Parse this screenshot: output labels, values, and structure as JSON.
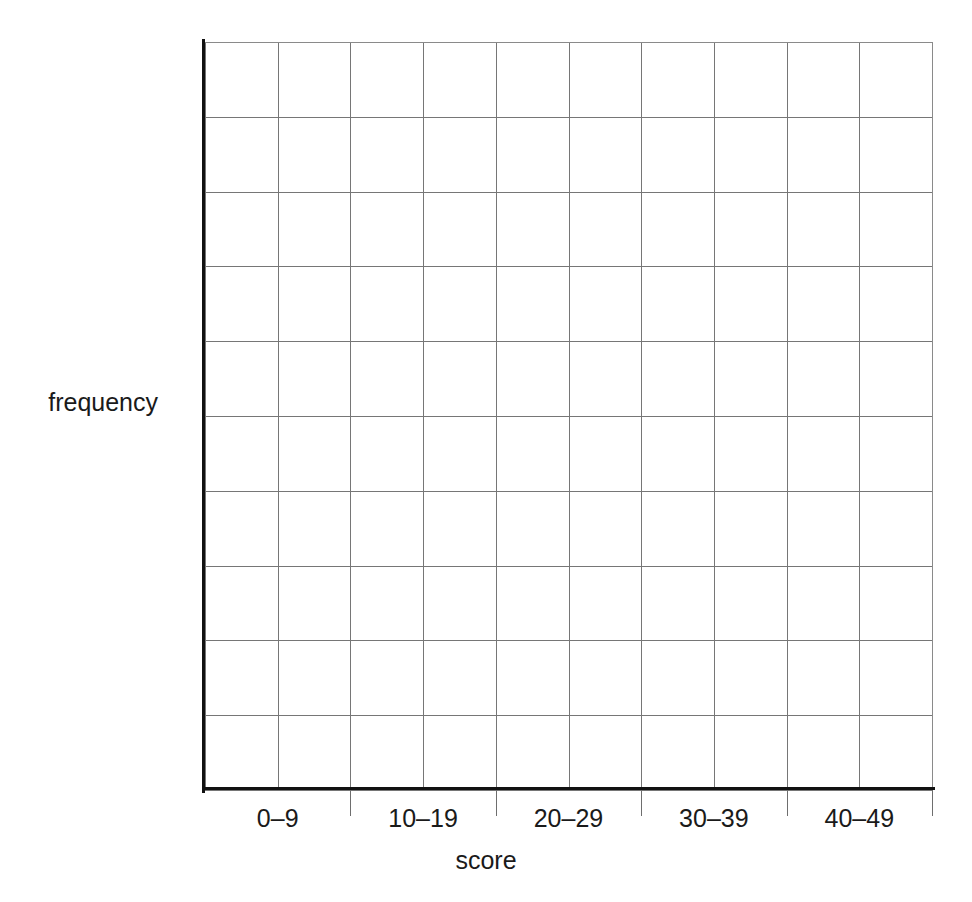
{
  "chart_data": {
    "type": "bar",
    "title": "",
    "subtitle": "",
    "xlabel": "score",
    "ylabel": "frequency",
    "categories": [
      "0–9",
      "10–19",
      "20–29",
      "30–39",
      "40–49"
    ],
    "values": [
      null,
      null,
      null,
      null,
      null
    ],
    "series": [
      {
        "name": "frequency",
        "values": [
          null,
          null,
          null,
          null,
          null
        ]
      }
    ],
    "note": "Empty grid template — no bars drawn; axes unlabelled numerically",
    "grid": true,
    "grid_columns": 10,
    "grid_rows": 10,
    "legend": false,
    "legend_position": "none",
    "annotations": [],
    "ylim": [
      null,
      null
    ],
    "ytick_labels": [],
    "xtick_labels": [
      "0–9",
      "10–19",
      "20–29",
      "30–39",
      "40–49"
    ],
    "colors": {
      "background": "#ffffff",
      "grid": "#767676",
      "axis": "#111111",
      "text": "#1a1a1a"
    }
  },
  "axes": {
    "x_title": "score",
    "y_title": "frequency"
  },
  "x_labels": [
    {
      "text": "0–9"
    },
    {
      "text": "10–19"
    },
    {
      "text": "20–29"
    },
    {
      "text": "30–39"
    },
    {
      "text": "40–49"
    }
  ]
}
